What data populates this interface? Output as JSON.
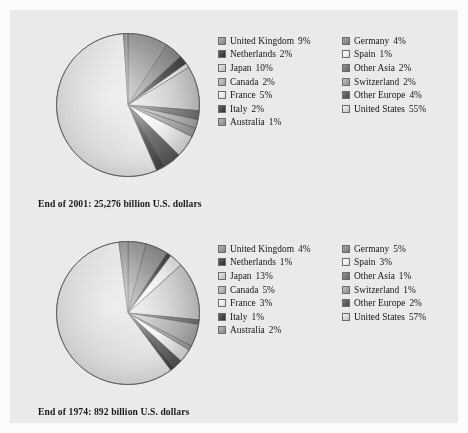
{
  "document": {
    "title": "World stock market capitalization by country",
    "background_color": "#ececeb"
  },
  "charts": [
    {
      "id": "chart-2001",
      "caption": "End of 2001: 25,276 billion U.S. dollars",
      "legend_left": [
        {
          "label": "United Kingdom",
          "pct": "9%"
        },
        {
          "label": "Netherlands",
          "pct": "2%"
        },
        {
          "label": "Japan",
          "pct": "10%"
        },
        {
          "label": "Canada",
          "pct": "2%"
        },
        {
          "label": "France",
          "pct": "5%"
        },
        {
          "label": "Italy",
          "pct": "2%"
        },
        {
          "label": "Australia",
          "pct": "1%"
        }
      ],
      "legend_right": [
        {
          "label": "Germany",
          "pct": "4%"
        },
        {
          "label": "Spain",
          "pct": "1%"
        },
        {
          "label": "Other Asia",
          "pct": "2%"
        },
        {
          "label": "Switzerland",
          "pct": "2%"
        },
        {
          "label": "Other Europe",
          "pct": "4%"
        },
        {
          "label": "United States",
          "pct": "55%"
        }
      ]
    },
    {
      "id": "chart-1974",
      "caption": "End of 1974: 892 billion U.S. dollars",
      "legend_left": [
        {
          "label": "United Kingdom",
          "pct": "4%"
        },
        {
          "label": "Netherlands",
          "pct": "1%"
        },
        {
          "label": "Japan",
          "pct": "13%"
        },
        {
          "label": "Canada",
          "pct": "5%"
        },
        {
          "label": "France",
          "pct": "3%"
        },
        {
          "label": "Italy",
          "pct": "1%"
        },
        {
          "label": "Australia",
          "pct": "2%"
        }
      ],
      "legend_right": [
        {
          "label": "Germany",
          "pct": "5%"
        },
        {
          "label": "Spain",
          "pct": "3%"
        },
        {
          "label": "Other Asia",
          "pct": "1%"
        },
        {
          "label": "Switzerland",
          "pct": "1%"
        },
        {
          "label": "Other Europe",
          "pct": "2%"
        },
        {
          "label": "United States",
          "pct": "57%"
        }
      ]
    }
  ],
  "chart_data": [
    {
      "type": "pie",
      "title": "End of 2001: 25,276 billion U.S. dollars",
      "unit": "percent of world stock market capitalization",
      "total_label": "25,276 billion U.S. dollars",
      "categories": [
        "United Kingdom",
        "Germany",
        "Netherlands",
        "Spain",
        "Japan",
        "Other Asia",
        "Canada",
        "Switzerland",
        "France",
        "Other Europe",
        "Italy",
        "United States",
        "Australia"
      ],
      "values": [
        9,
        4,
        2,
        1,
        10,
        2,
        2,
        2,
        5,
        4,
        2,
        55,
        1
      ],
      "colors": [
        "#9a9a9a",
        "#8e8e8e",
        "#454545",
        "#f2f2f0",
        "#d2d2d2",
        "#7a7a7a",
        "#b4b4b4",
        "#a8a8a8",
        "#efefed",
        "#5e5e5e",
        "#4a4a4a",
        "#dcdcda",
        "#9f9f9f"
      ],
      "legend_position": "right",
      "start_angle_deg": 0,
      "direction": "clockwise"
    },
    {
      "type": "pie",
      "title": "End of 1974: 892 billion U.S. dollars",
      "unit": "percent of world stock market capitalization",
      "total_label": "892 billion U.S. dollars",
      "categories": [
        "United Kingdom",
        "Germany",
        "Netherlands",
        "Spain",
        "Japan",
        "Other Asia",
        "Canada",
        "Switzerland",
        "France",
        "Other Europe",
        "Italy",
        "United States",
        "Australia"
      ],
      "values": [
        4,
        5,
        1,
        3,
        13,
        1,
        5,
        1,
        3,
        2,
        1,
        57,
        2
      ],
      "colors": [
        "#9a9a9a",
        "#8e8e8e",
        "#454545",
        "#f2f2f0",
        "#d2d2d2",
        "#7a7a7a",
        "#b4b4b4",
        "#a8a8a8",
        "#efefed",
        "#5e5e5e",
        "#4a4a4a",
        "#dcdcda",
        "#9f9f9f"
      ],
      "legend_position": "right",
      "start_angle_deg": 0,
      "direction": "clockwise"
    }
  ]
}
